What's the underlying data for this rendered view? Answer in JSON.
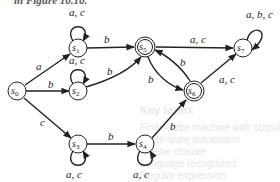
{
  "caption_fragment": "in Figure 10.10.",
  "background_text": {
    "heading": "Key terms",
    "lines": [
      "Finite-state machine with output",
      "Finite-state automaton",
      "Kleene closure",
      "Language recognized",
      "Regular expression"
    ]
  },
  "colors": {
    "stroke": "#222222",
    "background": "#ffffff"
  },
  "diagram": {
    "type": "finite-state-automaton",
    "start_state": "s0",
    "states": [
      {
        "id": "s0",
        "label": "s",
        "sub": "0",
        "final": false,
        "x": 17,
        "y": 91
      },
      {
        "id": "s1",
        "label": "s",
        "sub": "1",
        "final": false,
        "x": 78,
        "y": 48
      },
      {
        "id": "s2",
        "label": "s",
        "sub": "2",
        "final": false,
        "x": 78,
        "y": 91
      },
      {
        "id": "s3",
        "label": "s",
        "sub": "3",
        "final": false,
        "x": 78,
        "y": 144
      },
      {
        "id": "s4",
        "label": "s",
        "sub": "4",
        "final": false,
        "x": 145,
        "y": 144
      },
      {
        "id": "s5",
        "label": "s",
        "sub": "5",
        "final": true,
        "x": 145,
        "y": 47
      },
      {
        "id": "s6",
        "label": "s",
        "sub": "6",
        "final": true,
        "x": 194,
        "y": 91
      },
      {
        "id": "s7",
        "label": "s",
        "sub": "7",
        "final": false,
        "x": 243,
        "y": 48
      }
    ],
    "transitions": [
      {
        "from": "s0",
        "to": "s1",
        "label": "a"
      },
      {
        "from": "s0",
        "to": "s2",
        "label": "b"
      },
      {
        "from": "s0",
        "to": "s3",
        "label": "c"
      },
      {
        "from": "s1",
        "to": "s1",
        "label": "a, c"
      },
      {
        "from": "s1",
        "to": "s5",
        "label": "b"
      },
      {
        "from": "s2",
        "to": "s2",
        "label": "a, c"
      },
      {
        "from": "s2",
        "to": "s5",
        "label": "b"
      },
      {
        "from": "s3",
        "to": "s3",
        "label": "a, c"
      },
      {
        "from": "s3",
        "to": "s4",
        "label": "b"
      },
      {
        "from": "s4",
        "to": "s4",
        "label": "a, c"
      },
      {
        "from": "s4",
        "to": "s6",
        "label": "b"
      },
      {
        "from": "s5",
        "to": "s7",
        "label": "a, c"
      },
      {
        "from": "s5",
        "to": "s6",
        "label": "b"
      },
      {
        "from": "s6",
        "to": "s5",
        "label": "b"
      },
      {
        "from": "s6",
        "to": "s7",
        "label": "a, c"
      },
      {
        "from": "s7",
        "to": "s7",
        "label": "a, b, c"
      }
    ]
  },
  "labels": {
    "s0_s1": "a",
    "s0_s2": "b",
    "s0_s3": "c",
    "s1_loop": "a, c",
    "s1_s5": "b",
    "s2_loop": "a, c",
    "s2_s5": "b",
    "s3_loop": "a, c",
    "s3_s4": "b",
    "s4_loop": "a, c",
    "s4_s6": "b",
    "s5_s7": "a, c",
    "s5_s6": "b",
    "s6_s5": "b",
    "s6_s7": "a, c",
    "s7_loop": "a, b, c"
  }
}
